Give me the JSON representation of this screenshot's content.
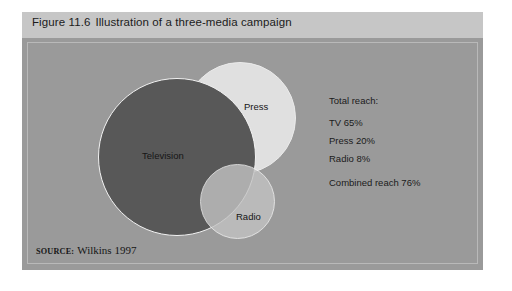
{
  "figure": {
    "number": "Figure 11.6",
    "title": "Illustration of a three-media campaign"
  },
  "venn": {
    "circles": [
      {
        "name": "television",
        "label": "Television",
        "color": "#585858"
      },
      {
        "name": "press",
        "label": "Press",
        "color": "#e6e6e6"
      },
      {
        "name": "radio",
        "label": "Radio",
        "color": "#c3c3c3"
      }
    ]
  },
  "stats": {
    "heading": "Total reach:",
    "items": [
      {
        "label": "TV 65%",
        "medium": "TV",
        "value": "65%"
      },
      {
        "label": "Press 20%",
        "medium": "Press",
        "value": "20%"
      },
      {
        "label": "Radio 8%",
        "medium": "Radio",
        "value": "8%"
      }
    ],
    "combined": "Combined reach 76%"
  },
  "source": {
    "word": "SOURCE:",
    "reference": "Wilkins 1997"
  },
  "colors": {
    "page_background": "#ffffff",
    "header_bar": "#c6c6c6",
    "body_background": "#9a9a9a",
    "inset_border": "#b9b9b9",
    "circle_stroke": "#f2f2f2",
    "text": "#1a1a1a"
  },
  "chart_data": {
    "type": "venn",
    "title": "Illustration of a three-media campaign",
    "sets": [
      {
        "name": "Television",
        "reach_percent": 65,
        "fill": "#585858",
        "radius_px": 79
      },
      {
        "name": "Press",
        "reach_percent": 20,
        "fill": "#e6e6e6",
        "radius_px": 56
      },
      {
        "name": "Radio",
        "reach_percent": 8,
        "fill": "#c3c3c3",
        "radius_px": 37
      }
    ],
    "combined_reach_percent": 76,
    "unit": "%",
    "legend": "none",
    "annotations": [
      "Total reach:",
      "TV 65%",
      "Press 20%",
      "Radio 8%",
      "Combined reach 76%"
    ],
    "source": "Wilkins 1997"
  }
}
